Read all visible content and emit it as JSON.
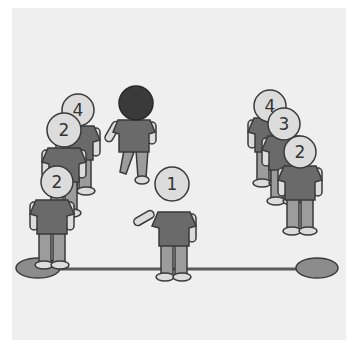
{
  "scene": {
    "description": "Relay race illustration: two teams lined up, runners numbered 1-4",
    "colors": {
      "background": "#efefef",
      "shirt": "#6a6a6a",
      "pants": "#9c9c9c",
      "skin": "#dcdcdc",
      "outline": "#3a3a3a",
      "mat": "#8c8c8c",
      "runner_head": "#3a3a3a"
    },
    "left_team": {
      "players": [
        {
          "number": "4"
        },
        {
          "number": "3"
        },
        {
          "number": "2"
        }
      ]
    },
    "right_team": {
      "players": [
        {
          "number": "4"
        },
        {
          "number": "3"
        },
        {
          "number": "2"
        }
      ]
    },
    "center": {
      "runner": {
        "number": ""
      },
      "waiting": {
        "number": "1"
      }
    }
  }
}
